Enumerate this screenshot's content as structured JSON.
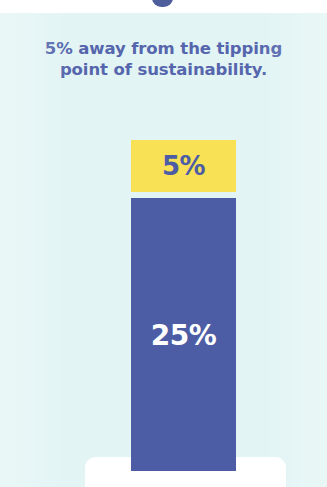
{
  "background_color": "#e2f4f4",
  "caption": {
    "line1": "5% away from the tipping",
    "line2": "point of sustainability.",
    "color": "#5566ad"
  },
  "chart_data": {
    "type": "bar",
    "title": "5% away from the tipping point of sustainability.",
    "xlabel": "",
    "ylabel": "",
    "grid": false,
    "legend": "none",
    "stacked": true,
    "categories": [
      "Sustainability"
    ],
    "series": [
      {
        "name": "Remaining gap to tipping point",
        "label": "5%",
        "values": [
          5
        ],
        "color": "#f8e155",
        "label_color": "#4d5da5"
      },
      {
        "name": "Achieved toward tipping point",
        "label": "25%",
        "values": [
          25
        ],
        "color": "#4d5da5",
        "label_color": "#ffffff"
      }
    ],
    "ylim": [
      0,
      30
    ],
    "units": "%"
  },
  "base_shelf": {
    "color": "#ffffff"
  }
}
